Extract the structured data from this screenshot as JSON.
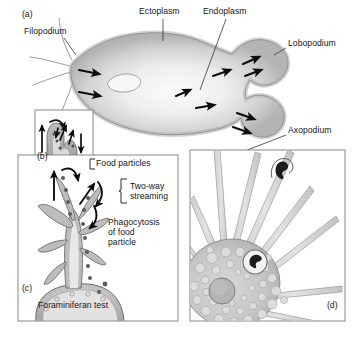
{
  "figure": {
    "background": "#ffffff",
    "width": 354,
    "height": 337
  },
  "palette": {
    "outline": "#4a4a4a",
    "ectoplasm": "#b9b9b9",
    "endoplasm": "#efefef",
    "cytoplasm_mid": "#c8c8c8",
    "arrow": "#0d0d0d",
    "panel_border": "#7a7a7a",
    "food_particle": "#5b5b5b",
    "text": "#161616",
    "nucleus": "#a8a8a8"
  },
  "panels": [
    {
      "id": "a",
      "key": "panel_a",
      "label": "(a)",
      "caption": "Amoeba with lobopodia and filopodia showing cytoplasmic streaming",
      "bordered": false,
      "labels": [
        {
          "name": "filopodium",
          "text": "Filopodium",
          "x": 24,
          "y": 31,
          "leader": true
        },
        {
          "name": "ectoplasm",
          "text": "Ectoplasm",
          "x": 139,
          "y": 11,
          "leader": true
        },
        {
          "name": "endoplasm",
          "text": "Endoplasm",
          "x": 203,
          "y": 11,
          "leader": true
        },
        {
          "name": "lobopodium",
          "text": "Lobopodium",
          "x": 288,
          "y": 43,
          "leader": true
        }
      ]
    },
    {
      "id": "b",
      "key": "panel_b",
      "label": "(b)",
      "caption": "Close-up of bifurcating pseudopod with two-way streaming arrows",
      "bordered": true,
      "box": {
        "x": 35,
        "y": 110,
        "w": 58,
        "h": 58
      },
      "labels": []
    },
    {
      "id": "c",
      "key": "panel_c",
      "label": "(c)",
      "caption": "Foraminiferan with reticulopodia capturing and phagocytosing food",
      "bordered": true,
      "box": {
        "x": 18,
        "y": 155,
        "w": 160,
        "h": 166
      },
      "labels": [
        {
          "name": "food-particles",
          "text": "Food particles",
          "x": 96,
          "y": 163,
          "leader": true
        },
        {
          "name": "two-way-streaming",
          "text": "Two-way\nstreaming",
          "x": 130,
          "y": 186,
          "leader": false
        },
        {
          "name": "phagocytosis",
          "text": "Phagocytosis\nof food\nparticle",
          "x": 108,
          "y": 222,
          "leader": false
        },
        {
          "name": "foraminiferan-test",
          "text": "Foraminiferan test",
          "x": 38,
          "y": 305,
          "leader": false
        }
      ]
    },
    {
      "id": "d",
      "key": "panel_d",
      "label": "(d)",
      "caption": "Heliozoan / actinopod cell with radiating axopodia and captured prey",
      "bordered": true,
      "box": {
        "x": 190,
        "y": 150,
        "w": 155,
        "h": 171
      },
      "labels": [
        {
          "name": "axopodium",
          "text": "Axopodium",
          "x": 288,
          "y": 130,
          "leader": true
        }
      ]
    }
  ],
  "panel_ids": {
    "a": {
      "text": "(a)",
      "x": 22,
      "y": 14
    },
    "b": {
      "text": "(b)",
      "x": 37,
      "y": 156
    },
    "c": {
      "text": "(c)",
      "x": 22,
      "y": 288
    },
    "d": {
      "text": "(d)",
      "x": 327,
      "y": 305
    }
  },
  "structures": {
    "panel_a": {
      "streaming_arrows": 9,
      "filopodia_count": 4,
      "lobopodia_count": 2,
      "nucleus_visible": true
    },
    "panel_b": {
      "streaming_arrows": 6,
      "food_particles": 5,
      "pseudopod_shape": "bifurcated"
    },
    "panel_c": {
      "food_particles": 14,
      "reticulopodia_branches": 7,
      "test_pores": 5,
      "arrows": 5
    },
    "panel_d": {
      "axopodia_count": 10,
      "vacuoles": 38,
      "nucleus_visible": true,
      "captured_prey": 2
    }
  }
}
